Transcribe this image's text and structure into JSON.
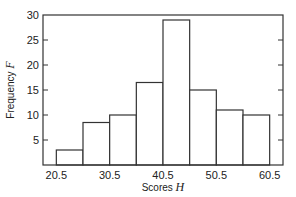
{
  "chart_data": {
    "type": "bar",
    "subtype": "histogram",
    "title": "",
    "xlabel": "Scores",
    "xlabel_var": "H",
    "ylabel": "Frequency",
    "ylabel_var": "F",
    "bin_edges": [
      20.5,
      25.5,
      30.5,
      35.5,
      40.5,
      45.5,
      50.5,
      55.5,
      60.5
    ],
    "categories": [
      "20.5-25.5",
      "25.5-30.5",
      "30.5-35.5",
      "35.5-40.5",
      "40.5-45.5",
      "45.5-50.5",
      "50.5-55.5",
      "55.5-60.5"
    ],
    "values": [
      3,
      8.5,
      10,
      16.5,
      29,
      15,
      11,
      10
    ],
    "x_tick_labels": [
      "20.5",
      "30.5",
      "40.5",
      "50.5",
      "60.5"
    ],
    "x_ticks": [
      20.5,
      30.5,
      40.5,
      50.5,
      60.5
    ],
    "y_tick_labels": [
      "5",
      "10",
      "15",
      "20",
      "25",
      "30"
    ],
    "y_ticks": [
      5,
      10,
      15,
      20,
      25,
      30
    ],
    "xlim": [
      18,
      63
    ],
    "ylim": [
      0,
      30
    ],
    "grid": false,
    "legend": null,
    "colors": {
      "bar_fill": "#ffffff",
      "bar_edge": "#333333",
      "frame": "#333333"
    }
  }
}
